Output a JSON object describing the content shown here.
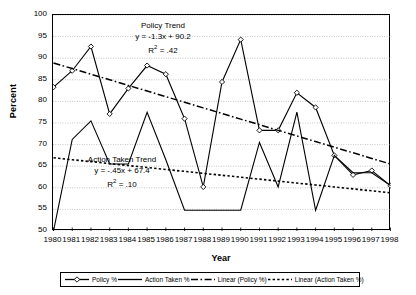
{
  "chart_data": {
    "type": "line",
    "title": "",
    "xlabel": "Year",
    "ylabel": "Percent",
    "ylim": [
      50,
      100
    ],
    "ytick_step": 5,
    "grid": true,
    "categories": [
      1980,
      1981,
      1982,
      1983,
      1984,
      1985,
      1986,
      1987,
      1988,
      1989,
      1990,
      1991,
      1992,
      1993,
      1994,
      1995,
      1996,
      1997,
      1998
    ],
    "xtick_labels": [
      "1980",
      "1981",
      "1982",
      "1983",
      "1984",
      "1985",
      "1986",
      "1987",
      "1988",
      "1989",
      "1990",
      "1991",
      "1992",
      "1993",
      "1994",
      "1995",
      "1996",
      "1997",
      "1998"
    ],
    "ytick_labels": [
      "50",
      "55",
      "60",
      "65",
      "70",
      "75",
      "80",
      "85",
      "90",
      "95",
      "100"
    ],
    "series": [
      {
        "name": "Policy %",
        "marker": "open-diamond",
        "style": "solid",
        "color": "#000000",
        "values": [
          83.3,
          87.1,
          92.7,
          77.1,
          83.0,
          88.3,
          86.3,
          76.0,
          60.2,
          84.5,
          94.3,
          73.3,
          73.3,
          82.0,
          78.6,
          67.5,
          63.0,
          64.0,
          60.5
        ]
      },
      {
        "name": "Action Taken %",
        "marker": "none",
        "style": "solid",
        "color": "#000000",
        "values": [
          50.0,
          71.2,
          75.5,
          65.5,
          65.5,
          77.5,
          66.5,
          54.8,
          54.8,
          54.8,
          54.8,
          70.5,
          60.2,
          77.5,
          54.8,
          67.5,
          63.5,
          63.5,
          60.5
        ]
      },
      {
        "name": "Linear (Policy %)",
        "marker": "none",
        "style": "dash-dot",
        "color": "#000000",
        "trend": {
          "slope": -1.3,
          "intercept": 90.2,
          "r2": 0.42
        },
        "values": [
          88.9,
          87.6,
          86.3,
          85.0,
          83.7,
          82.4,
          81.1,
          79.8,
          78.5,
          77.2,
          75.9,
          74.6,
          73.3,
          72.0,
          70.7,
          69.4,
          68.1,
          66.8,
          65.5
        ]
      },
      {
        "name": "Linear (Action Taken %)",
        "marker": "none",
        "style": "dotted",
        "color": "#000000",
        "trend": {
          "slope": -0.45,
          "intercept": 67.4,
          "r2": 0.1
        },
        "values": [
          66.95,
          66.5,
          66.05,
          65.6,
          65.15,
          64.7,
          64.25,
          63.8,
          63.35,
          62.9,
          62.45,
          62.0,
          61.55,
          61.1,
          60.65,
          60.2,
          59.75,
          59.3,
          58.85
        ]
      }
    ],
    "annotations": [
      {
        "id": "policy",
        "title": "Policy Trend",
        "equation": "y = -1.3x + 90.2",
        "r2_prefix": "R",
        "r2_sup": "2",
        "r2_value": " = .42"
      },
      {
        "id": "action",
        "title": "Action Taken Trend",
        "equation": "y = -.45x + 67.4",
        "r2_prefix": "R",
        "r2_sup": "2",
        "r2_value": " = .10"
      }
    ],
    "legend": {
      "position": "bottom",
      "entries": [
        {
          "label": "Policy %",
          "marker": "open-diamond",
          "style": "solid"
        },
        {
          "label": "Action Taken %",
          "marker": "none",
          "style": "solid"
        },
        {
          "label": "Linear (Policy %)",
          "marker": "none",
          "style": "dash-dot"
        },
        {
          "label": "Linear (Action Taken %)",
          "marker": "none",
          "style": "dotted"
        }
      ]
    }
  }
}
